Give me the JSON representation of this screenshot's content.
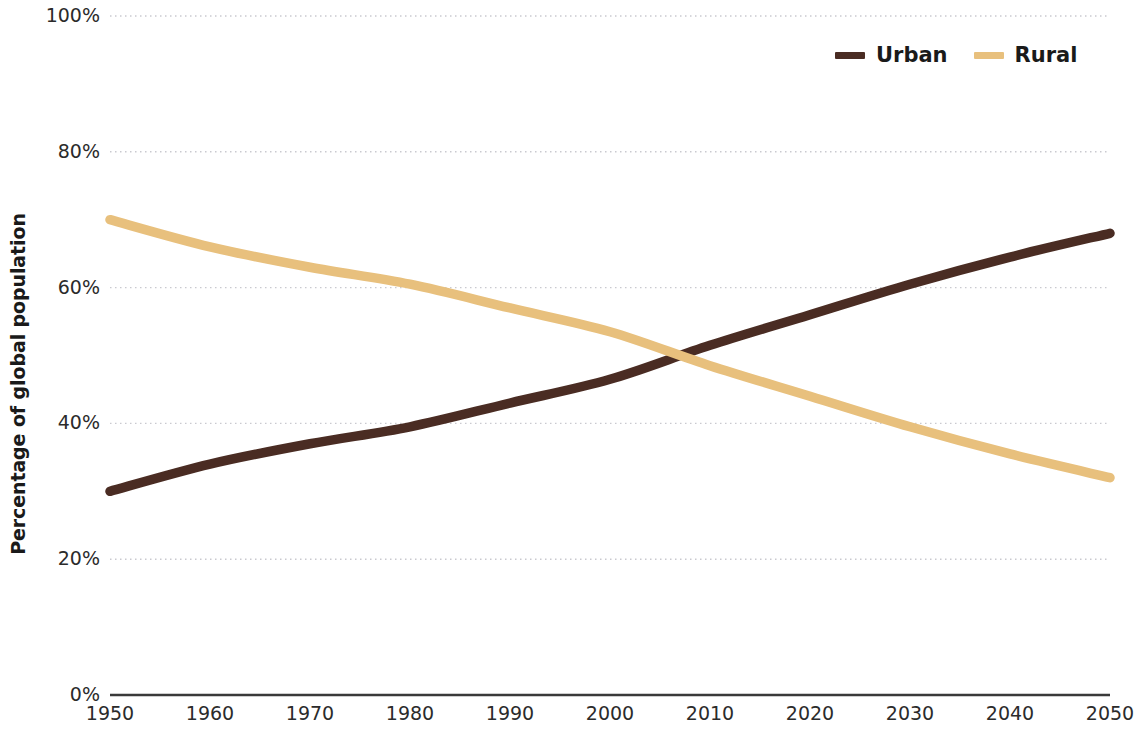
{
  "chart_data": {
    "type": "line",
    "title": "",
    "subtitle": "",
    "xlabel": "",
    "ylabel": "Percentage of global population",
    "x": [
      1950,
      1960,
      1970,
      1980,
      1990,
      2000,
      2010,
      2020,
      2030,
      2040,
      2050
    ],
    "categories": [
      "1950",
      "1960",
      "1970",
      "1980",
      "1990",
      "2000",
      "2010",
      "2020",
      "2030",
      "2040",
      "2050"
    ],
    "series": [
      {
        "name": "Urban",
        "color": "#4a2c23",
        "values": [
          30,
          34,
          37,
          39.5,
          43,
          46.5,
          51.5,
          56,
          60.5,
          64.5,
          68
        ]
      },
      {
        "name": "Rural",
        "color": "#e8c07d",
        "values": [
          70,
          66,
          63,
          60.5,
          57,
          53.5,
          48.5,
          44,
          39.5,
          35.5,
          32
        ]
      }
    ],
    "xlim": [
      1950,
      2050
    ],
    "ylim": [
      0,
      100
    ],
    "y_ticks": [
      0,
      20,
      40,
      60,
      80,
      100
    ],
    "y_tick_labels": [
      "0%",
      "20%",
      "40%",
      "60%",
      "80%",
      "100%"
    ],
    "x_ticks": [
      1950,
      1960,
      1970,
      1980,
      1990,
      2000,
      2010,
      2020,
      2030,
      2040,
      2050
    ],
    "grid": "horizontal-dotted",
    "grid_color": "#c9c9cf",
    "axis_color": "#3a3a3a",
    "legend_position": "top-right",
    "crossover": {
      "x": 2007,
      "y": 50
    }
  },
  "axis": {
    "y_title": "Percentage of global population",
    "y_labels": [
      "100%",
      "80%",
      "60%",
      "40%",
      "20%",
      "0%"
    ],
    "x_labels": [
      "1950",
      "1960",
      "1970",
      "1980",
      "1990",
      "2000",
      "2010",
      "2020",
      "2030",
      "2040",
      "2050"
    ]
  },
  "legend": {
    "items": [
      {
        "label": "Urban",
        "color": "#4a2c23"
      },
      {
        "label": "Rural",
        "color": "#e8c07d"
      }
    ]
  }
}
